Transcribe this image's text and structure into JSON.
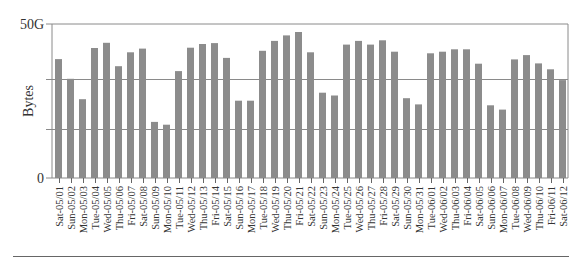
{
  "chart_data": {
    "type": "bar",
    "title": "",
    "xlabel": "",
    "ylabel": "Bytes",
    "ylim": [
      0,
      50
    ],
    "y_unit": "G",
    "yticks": [
      {
        "value": 0,
        "label": "0"
      },
      {
        "value": 50,
        "label": "50G"
      }
    ],
    "gridlines": [
      16,
      32
    ],
    "grid": true,
    "legend": null,
    "bar_color": "#8c8c8c",
    "categories": [
      "Sat-05/01",
      "Sun-05/02",
      "Mon-05/03",
      "Tue-05/04",
      "Wed-05/05",
      "Thu-05/06",
      "Fri-05/07",
      "Sat-05/08",
      "Sun-05/09",
      "Mon-05/10",
      "Tue-05/11",
      "Wed-05/12",
      "Thu-05/13",
      "Fri-05/14",
      "Sat-05/15",
      "Sun-05/16",
      "Mon-05/17",
      "Tue-05/18",
      "Wed-05/19",
      "Thu-05/20",
      "Fri-05/21",
      "Sat-05/22",
      "Sun-05/23",
      "Mon-05/24",
      "Tue-05/25",
      "Wed-05/26",
      "Thu-05/27",
      "Fri-05/28",
      "Sat-05/29",
      "Sun-05/30",
      "Mon-05/31",
      "Tue-06/01",
      "Wed-06/02",
      "Thu-06/03",
      "Fri-06/04",
      "Sat-06/05",
      "Sun-06/06",
      "Mon-06/07",
      "Tue-06/08",
      "Wed-06/09",
      "Thu-06/10",
      "Fri-06/11",
      "Sat-06/12"
    ],
    "values": [
      38.6,
      32.2,
      25.6,
      42.2,
      43.9,
      36.3,
      40.8,
      42.0,
      18.2,
      17.3,
      34.7,
      42.3,
      43.5,
      43.8,
      39.0,
      25.1,
      25.1,
      41.3,
      44.5,
      46.3,
      47.4,
      40.8,
      27.7,
      26.8,
      43.3,
      44.5,
      43.3,
      44.7,
      41.0,
      25.9,
      23.9,
      40.5,
      41.0,
      41.8,
      41.8,
      37.1,
      23.6,
      22.2,
      38.5,
      39.9,
      37.2,
      35.3,
      31.8
    ]
  }
}
